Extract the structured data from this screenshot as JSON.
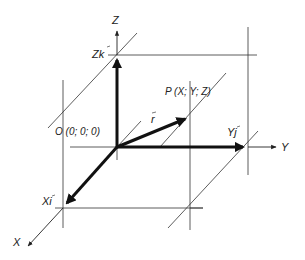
{
  "diagram": {
    "labels": {
      "z_axis": "Z",
      "y_axis": "Y",
      "x_axis": "X",
      "zk": "Zk",
      "yj": "Yj",
      "xi": "Xi",
      "r": "r",
      "point_p": "P (X; Y; Z)",
      "origin": "O (0; 0; 0)"
    },
    "colors": {
      "line": "#333333",
      "vector": "#111111",
      "background": "#ffffff"
    }
  }
}
